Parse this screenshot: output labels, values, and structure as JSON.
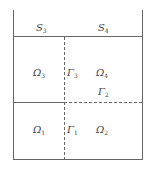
{
  "diagram": {
    "type": "domain-decomposition",
    "line_color": "#555555",
    "labels": {
      "S3": {
        "base": "S",
        "sub": "3"
      },
      "S4": {
        "base": "S",
        "sub": "4"
      },
      "Omega3": {
        "base": "Ω",
        "sub": "3"
      },
      "Gamma3": {
        "base": "Γ",
        "sub": "3"
      },
      "Omega4": {
        "base": "Ω",
        "sub": "4"
      },
      "Gamma2": {
        "base": "Γ",
        "sub": "2"
      },
      "Omega1": {
        "base": "Ω",
        "sub": "1"
      },
      "Gamma1": {
        "base": "Γ",
        "sub": "1"
      },
      "Omega2": {
        "base": "Ω",
        "sub": "2"
      }
    }
  }
}
